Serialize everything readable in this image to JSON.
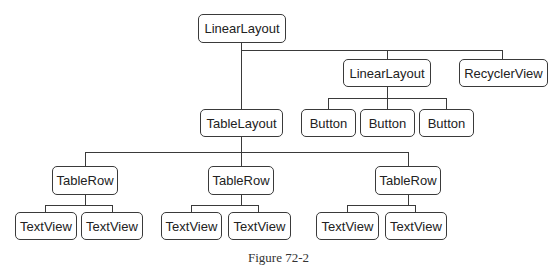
{
  "diagram": {
    "type": "tree",
    "root": {
      "label": "LinearLayout",
      "children": [
        {
          "label": "TableLayout",
          "children": [
            {
              "label": "TableRow",
              "children": [
                {
                  "label": "TextView"
                },
                {
                  "label": "TextView"
                }
              ]
            },
            {
              "label": "TableRow",
              "children": [
                {
                  "label": "TextView"
                },
                {
                  "label": "TextView"
                }
              ]
            },
            {
              "label": "TableRow",
              "children": [
                {
                  "label": "TextView"
                },
                {
                  "label": "TextView"
                }
              ]
            }
          ]
        },
        {
          "label": "LinearLayout",
          "children": [
            {
              "label": "Button"
            },
            {
              "label": "Button"
            },
            {
              "label": "Button"
            }
          ]
        },
        {
          "label": "RecyclerView"
        }
      ]
    }
  },
  "nodes": {
    "root_linear_layout": "LinearLayout",
    "child_linear_layout": "LinearLayout",
    "recycler_view": "RecyclerView",
    "table_layout": "TableLayout",
    "buttons": [
      "Button",
      "Button",
      "Button"
    ],
    "table_rows": [
      "TableRow",
      "TableRow",
      "TableRow"
    ],
    "text_views": [
      "TextView",
      "TextView",
      "TextView",
      "TextView",
      "TextView",
      "TextView"
    ]
  },
  "caption": "Figure 72-2",
  "colors": {
    "stroke": "#3a3a3a",
    "text": "#222222",
    "background": "#ffffff"
  }
}
